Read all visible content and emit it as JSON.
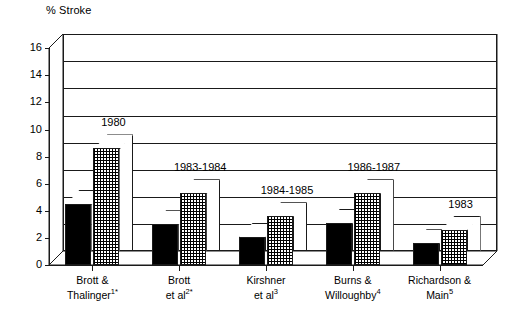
{
  "chart_data": {
    "type": "bar",
    "title": "",
    "ylabel": "% Stroke",
    "xlabel": "",
    "ylim": [
      0,
      16
    ],
    "ytick_values": [
      0,
      2,
      4,
      6,
      8,
      10,
      12,
      14,
      16
    ],
    "ytick_labels": [
      "0",
      "2",
      "4",
      "6",
      "8",
      "10",
      "12",
      "14",
      "16"
    ],
    "grid": true,
    "legend": "none",
    "style": "3d-clustered-column",
    "categories": [
      "Brott & Thalinger1*",
      "Brott et al2*",
      "Kirshner et al3",
      "Burns & Willoughby4",
      "Richardson & Main5"
    ],
    "annotations": [
      "1980",
      "1983-1984",
      "1984-1985",
      "1986-1987",
      "1983"
    ],
    "series": [
      {
        "name": "solid",
        "fill": "black",
        "values": [
          4.5,
          3.0,
          2.1,
          3.1,
          1.6
        ]
      },
      {
        "name": "hatched",
        "fill": "cross-hatch",
        "values": [
          8.6,
          5.3,
          3.6,
          5.3,
          2.6
        ]
      }
    ]
  },
  "axis": {
    "y_title": "% Stroke",
    "ticks": [
      {
        "label": "16",
        "value": 16
      },
      {
        "label": "14",
        "value": 14
      },
      {
        "label": "12",
        "value": 12
      },
      {
        "label": "10",
        "value": 10
      },
      {
        "label": "8",
        "value": 8
      },
      {
        "label": "6",
        "value": 6
      },
      {
        "label": "4",
        "value": 4
      },
      {
        "label": "2",
        "value": 2
      },
      {
        "label": "0",
        "value": 0
      }
    ]
  },
  "groups": [
    {
      "year": "1980",
      "label_line1": "Brott &",
      "label_line2": "Thalinger",
      "label_sup": "1*",
      "solid": 4.5,
      "hatch": 8.6
    },
    {
      "year": "1983-1984",
      "label_line1": "Brott",
      "label_line2": "et al",
      "label_sup": "2*",
      "solid": 3.0,
      "hatch": 5.3
    },
    {
      "year": "1984-1985",
      "label_line1": "Kirshner",
      "label_line2": "et al",
      "label_sup": "3",
      "solid": 2.1,
      "hatch": 3.6
    },
    {
      "year": "1986-1987",
      "label_line1": "Burns &",
      "label_line2": "Willoughby",
      "label_sup": "4",
      "solid": 3.1,
      "hatch": 5.3
    },
    {
      "year": "1983",
      "label_line1": "Richardson &",
      "label_line2": "Main",
      "label_sup": "5",
      "solid": 1.6,
      "hatch": 2.6
    }
  ],
  "colors": {
    "ink": "#1a1a1a",
    "solid_bar": "#000000",
    "hatch_bar": "#ffffff",
    "background": "#ffffff"
  }
}
